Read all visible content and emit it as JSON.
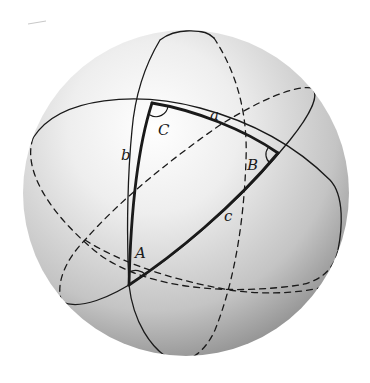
{
  "figure": {
    "colors": {
      "background": "#ffffff",
      "sphere_highlight": "#ffffff",
      "sphere_mid": "#dcdcdc",
      "sphere_shadow": "#8c8c8c",
      "line": "#1a1a1a"
    },
    "vertices": [
      {
        "name": "A",
        "label": "A"
      },
      {
        "name": "B",
        "label": "B"
      },
      {
        "name": "C",
        "label": "C"
      }
    ],
    "sides": [
      {
        "name": "a",
        "label": "a"
      },
      {
        "name": "b",
        "label": "b"
      },
      {
        "name": "c",
        "label": "c"
      }
    ]
  }
}
